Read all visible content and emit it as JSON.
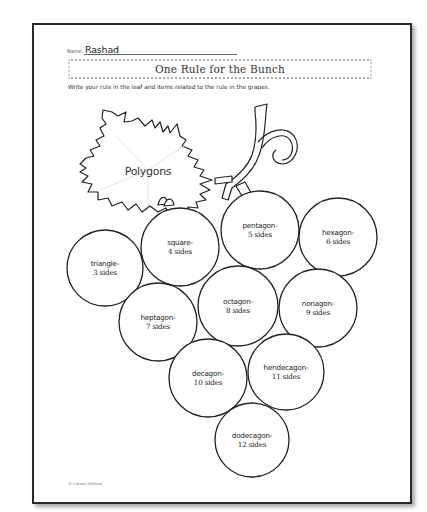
{
  "worksheet": {
    "name_label": "Name:",
    "name_value": "Rashad",
    "title": "One Rule for the Bunch",
    "instructions": "Write your rule in the leaf and items related to the rule in the grapes.",
    "copyright": "© Carson Dellosa"
  },
  "leaf": {
    "rule": "Polygons"
  },
  "grapes": [
    {
      "name": "triangle-",
      "sides": "3 sides"
    },
    {
      "name": "square-",
      "sides": "4 sides"
    },
    {
      "name": "pentagon-",
      "sides": "5 sides"
    },
    {
      "name": "hexagon-",
      "sides": "6 sides"
    },
    {
      "name": "heptagon-",
      "sides": "7 sides"
    },
    {
      "name": "octagon-",
      "sides": "8 sides"
    },
    {
      "name": "nonagon-",
      "sides": "9 sides"
    },
    {
      "name": "decagon-",
      "sides": "10 sides"
    },
    {
      "name": "hendecagon-",
      "sides": "11 sides"
    },
    {
      "name": "dodecagon-",
      "sides": "12 sides"
    }
  ]
}
